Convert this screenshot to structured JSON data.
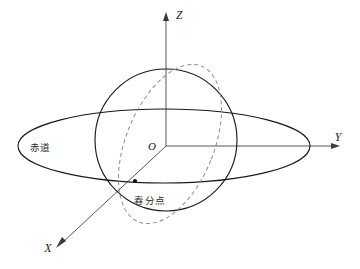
{
  "figure": {
    "background_color": "#ffffff"
  },
  "axes": {
    "z": {
      "label": "Z",
      "direction": "up",
      "origin": [
        166,
        146
      ],
      "tip": [
        166,
        14
      ],
      "arrow": "arrowhead-up",
      "color": "#595959"
    },
    "y": {
      "label": "Y",
      "direction": "right",
      "origin": [
        166,
        146
      ],
      "tip": [
        340,
        146
      ],
      "arrow": "arrowhead-right",
      "color": "#595959"
    },
    "x": {
      "label": "X",
      "direction": "down-left",
      "origin": [
        166,
        146
      ],
      "tip": [
        57,
        247
      ],
      "arrow": "arrowhead-down-left",
      "color": "#595959"
    }
  },
  "origin": {
    "label": "O",
    "x": 166,
    "y": 146
  },
  "curves": {
    "equator_plane": {
      "name": "equator-ellipse",
      "style": "solid",
      "center": [
        164,
        146
      ],
      "rx": 146,
      "ry": 37,
      "color": "#1a1a1a"
    },
    "sphere_outline": {
      "name": "sphere-circle",
      "style": "solid",
      "center": [
        166,
        140
      ],
      "r": 71,
      "color": "#1a1a1a"
    },
    "ecliptic": {
      "name": "ecliptic-ellipse",
      "style": "dashed",
      "center": [
        170,
        144
      ],
      "rx": 44,
      "ry": 84,
      "rotation_deg": 22,
      "color": "#8e8e93",
      "dash": "4 3"
    }
  },
  "labels": {
    "equator": {
      "text": "赤道",
      "x": 40,
      "y": 151
    },
    "vernal_equinox": {
      "text": "春分点",
      "x": 128,
      "y": 201
    }
  },
  "points": {
    "vernal_equinox_marker": {
      "name": "vernal-equinox-point",
      "x": 135,
      "y": 181,
      "radius": 2.1,
      "color": "#111111"
    }
  }
}
